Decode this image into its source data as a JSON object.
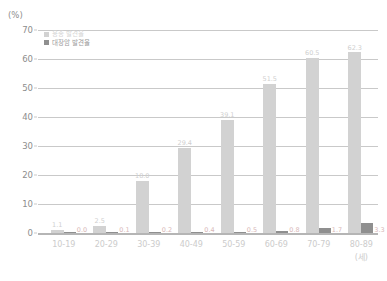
{
  "chart_data": {
    "type": "bar",
    "title": "",
    "xlabel": "(세)",
    "ylabel": "(%)",
    "ylim": [
      0,
      70
    ],
    "yticks": [
      0,
      10,
      20,
      30,
      40,
      50,
      60,
      70
    ],
    "grid": true,
    "legend_position": "top-left",
    "categories": [
      "10-19",
      "20-29",
      "30-39",
      "40-49",
      "50-59",
      "60-69",
      "70-79",
      "80-89"
    ],
    "series": [
      {
        "name": "용종 발견율",
        "color": "#d2d2d2",
        "values": [
          1.1,
          2.5,
          18.0,
          29.4,
          39.1,
          51.5,
          60.5,
          62.3
        ],
        "labels": [
          "1.1",
          "2.5",
          "18.0",
          "29.4",
          "39.1",
          "51.5",
          "60.5",
          "62.3"
        ]
      },
      {
        "name": "대장암 발견율",
        "color": "#8f8f8f",
        "values": [
          0.0,
          0.1,
          0.2,
          0.4,
          0.5,
          0.8,
          1.7,
          3.3
        ],
        "labels": [
          "0.0",
          "0.1",
          "0.2",
          "0.4",
          "0.5",
          "0.8",
          "1.7",
          "3.3"
        ]
      }
    ]
  },
  "axis": {
    "y_unit": "(%)",
    "x_unit": "(세)"
  }
}
